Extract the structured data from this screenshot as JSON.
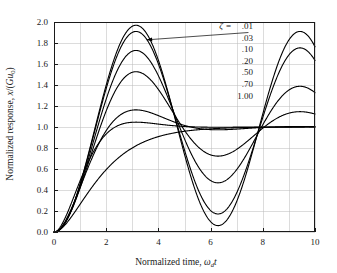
{
  "chart_data": {
    "type": "line",
    "title": "",
    "xlabel": "Normalized time, ω_d t",
    "ylabel": "Normalized response, x/(Gu₀)",
    "xlim": [
      0,
      10
    ],
    "ylim": [
      0,
      2.0
    ],
    "xticks": [
      0,
      2,
      4,
      6,
      8,
      10
    ],
    "xtick_labels": [
      "0",
      "2",
      "4",
      "6",
      "8",
      "10"
    ],
    "yticks": [
      0.0,
      0.2,
      0.4,
      0.6,
      0.8,
      1.0,
      1.2,
      1.4,
      1.6,
      1.8,
      2.0
    ],
    "ytick_labels": [
      "0.0",
      "0.2",
      "0.4",
      "0.6",
      "0.8",
      "1.0",
      "1.2",
      "1.4",
      "1.6",
      "1.8",
      "2.0"
    ],
    "grid": true,
    "grid_x_spacing": 1,
    "grid_y_spacing": 0.2,
    "legend_position": "inside-top-right",
    "legend_title": "ζ =",
    "series": [
      {
        "name": ".01",
        "zeta": 0.01,
        "first_peak": {
          "x": 3.1,
          "y": 1.92
        },
        "first_trough": {
          "x": 6.3,
          "y": 0.08
        },
        "second_peak": {
          "x": 9.45,
          "y": 1.9
        },
        "steady_state": 1.0
      },
      {
        "name": ".03",
        "zeta": 0.03,
        "first_peak": {
          "x": 3.1,
          "y": 1.86
        },
        "first_trough": {
          "x": 6.3,
          "y": 0.16
        },
        "second_peak": {
          "x": 9.45,
          "y": 1.77
        },
        "steady_state": 1.0
      },
      {
        "name": ".10",
        "zeta": 0.1,
        "first_peak": {
          "x": 3.14,
          "y": 1.72
        },
        "first_trough": {
          "x": 6.3,
          "y": 0.48
        },
        "second_peak": {
          "x": 9.45,
          "y": 1.39
        },
        "steady_state": 1.0
      },
      {
        "name": ".20",
        "zeta": 0.2,
        "first_peak": {
          "x": 3.14,
          "y": 1.51
        },
        "first_trough": {
          "x": 6.3,
          "y": 0.73
        },
        "second_peak": {
          "x": 9.45,
          "y": 1.16
        },
        "steady_state": 1.0
      },
      {
        "name": ".50",
        "zeta": 0.5,
        "first_peak": {
          "x": 3.6,
          "y": 1.16
        },
        "first_trough": {
          "x": 6.6,
          "y": 0.96
        },
        "second_peak": {
          "x": 9.6,
          "y": 1.01
        },
        "steady_state": 1.0
      },
      {
        "name": ".70",
        "zeta": 0.7,
        "first_peak": {
          "x": 3.8,
          "y": 1.05
        },
        "first_trough": {
          "x": 7.0,
          "y": 0.995
        },
        "second_peak": {
          "x": 10.0,
          "y": 1.0
        },
        "steady_state": 1.0
      },
      {
        "name": "1.00",
        "zeta": 1.0,
        "first_peak": {
          "x": 10.0,
          "y": 1.0
        },
        "first_trough": {
          "x": 10.0,
          "y": 1.0
        },
        "second_peak": {
          "x": 10.0,
          "y": 1.0
        },
        "steady_state": 1.0
      }
    ],
    "annotation": {
      "text": "arrow from legend to zeta = .01 curve",
      "from": {
        "x": 7.45,
        "y": 1.9
      },
      "to": {
        "x": 3.55,
        "y": 1.83
      }
    }
  },
  "axes": {
    "y_title_main": "Normalized response, ",
    "y_title_var": "x",
    "y_title_tail": "/(",
    "y_title_gain": "G",
    "y_title_u": "u",
    "y_title_u_sub": "0",
    "y_title_close": ")",
    "x_title_main": "Normalized time, ",
    "x_title_omega": "ω",
    "x_title_omega_sub": "d",
    "x_title_t": "t"
  },
  "legend": {
    "symbol": "ζ",
    "equals": "=",
    "entries": [
      ".01",
      ".03",
      ".10",
      ".20",
      ".50",
      ".70",
      "1.00"
    ]
  },
  "colors": {
    "curve": "#000000",
    "grid": "#b9b9b9",
    "frame": "#1a1a1a",
    "text": "#1a1a1a",
    "background": "#ffffff"
  }
}
